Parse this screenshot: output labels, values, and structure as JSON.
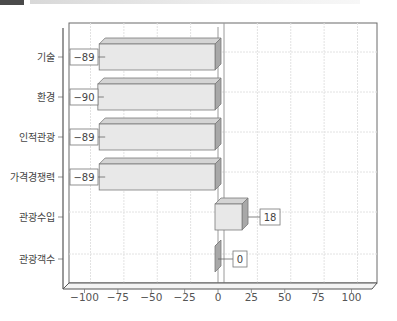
{
  "header": {
    "title_fragment": ""
  },
  "chart_data": {
    "type": "bar",
    "orientation": "horizontal",
    "style": "3d",
    "title": "",
    "xlabel": "",
    "ylabel": "",
    "categories": [
      "기술",
      "환경",
      "인적관광",
      "가격경쟁력",
      "관광수입",
      "관광객수"
    ],
    "values": [
      -89,
      -90,
      -89,
      -89,
      18,
      0
    ],
    "value_labels": [
      "−89",
      "−90",
      "−89",
      "−89",
      "18",
      "0"
    ],
    "xlim": [
      -112,
      112
    ],
    "xticks": [
      -100,
      -75,
      -50,
      -25,
      0,
      25,
      50,
      75,
      100
    ],
    "xtick_labels": [
      "−100",
      "−75",
      "−50",
      "−25",
      "0",
      "25",
      "50",
      "75",
      "100"
    ],
    "grid": true,
    "legend": null,
    "colors": {
      "bar_face": "#e8e8e8",
      "bar_top": "#d4d4d4",
      "bar_side": "#a8a8a8",
      "frame": "#555555",
      "grid": "#e2e2e2"
    }
  }
}
